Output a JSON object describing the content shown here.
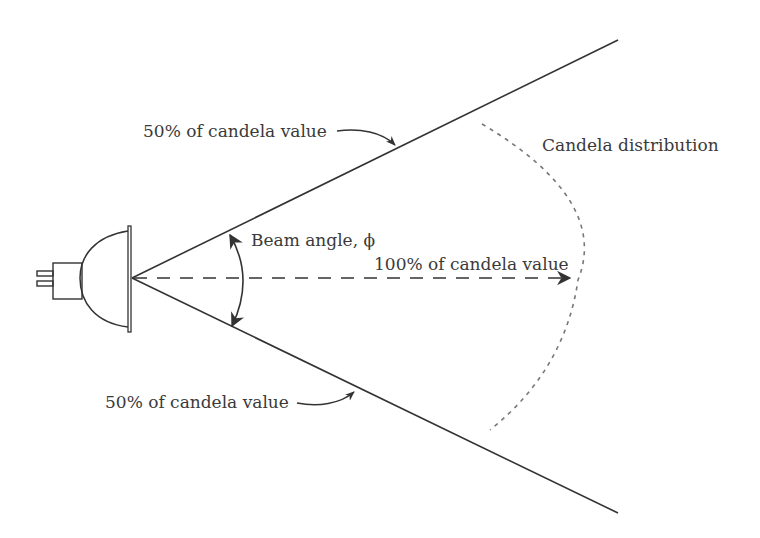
{
  "diagram": {
    "labels": {
      "upper_half_candela": "50% of candela value",
      "lower_half_candela": "50% of candela value",
      "beam_angle": "Beam angle, ϕ",
      "full_candela": "100% of candela value",
      "candela_distribution": "Candela distribution"
    },
    "colors": {
      "line": "#333333",
      "dashed_arc": "#777777",
      "text": "#3a3a3a",
      "background": "#ffffff"
    }
  }
}
